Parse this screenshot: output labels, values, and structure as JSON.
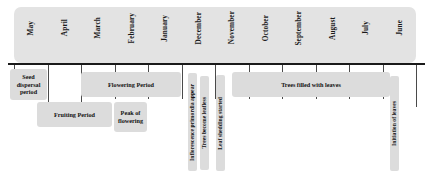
{
  "chart_data": {
    "type": "table",
    "xlabel": "",
    "ylabel": "",
    "grid": false,
    "legend": "none",
    "axis_orientation": "horizontal-reverse-chronological",
    "months": [
      {
        "label": "May",
        "left": 14,
        "width": 33.5
      },
      {
        "label": "April",
        "left": 47.5,
        "width": 33.5
      },
      {
        "label": "March",
        "left": 81,
        "width": 33.5
      },
      {
        "label": "February",
        "left": 114.5,
        "width": 33.5
      },
      {
        "label": "January",
        "left": 148,
        "width": 33.5
      },
      {
        "label": "December",
        "left": 181.5,
        "width": 33.5
      },
      {
        "label": "November",
        "left": 215,
        "width": 33.5
      },
      {
        "label": "October",
        "left": 248.5,
        "width": 33.5
      },
      {
        "label": "September",
        "left": 282,
        "width": 33.5
      },
      {
        "label": "August",
        "left": 315.5,
        "width": 33.5
      },
      {
        "label": "July",
        "left": 349,
        "width": 33.5
      },
      {
        "label": "June",
        "left": 382.5,
        "width": 33.5
      }
    ],
    "ticks": [
      {
        "left": 14,
        "height": 9
      },
      {
        "left": 47.5,
        "height": 42
      },
      {
        "left": 81,
        "height": 42
      },
      {
        "left": 114.5,
        "height": 34
      },
      {
        "left": 148,
        "height": 34
      },
      {
        "left": 181.5,
        "height": 34
      },
      {
        "left": 215,
        "height": 34
      },
      {
        "left": 248.5,
        "height": 34
      },
      {
        "left": 282,
        "height": 34
      },
      {
        "left": 315.5,
        "height": 34
      },
      {
        "left": 349,
        "height": 34
      },
      {
        "left": 382.5,
        "height": 34
      },
      {
        "left": 416,
        "height": 42
      }
    ],
    "phases": [
      {
        "label": "Seed dispersal period",
        "left": 10,
        "top": 69,
        "width": 37,
        "height": 31
      },
      {
        "label": "Flowering Period",
        "left": 81,
        "top": 72,
        "width": 100,
        "height": 25
      },
      {
        "label": "Fruiting Period",
        "left": 37,
        "top": 102,
        "width": 75,
        "height": 25
      },
      {
        "label": "Peak of flowering",
        "left": 114,
        "top": 102,
        "width": 33,
        "height": 30
      },
      {
        "label": "Trees filled with leaves",
        "left": 232,
        "top": 72,
        "width": 158,
        "height": 25
      }
    ],
    "events": [
      {
        "label": "Inflorescence primordia appear",
        "left": 188,
        "top": 73,
        "width": 9,
        "height": 98
      },
      {
        "label": "Trees become leafless",
        "left": 200,
        "top": 76,
        "width": 9,
        "height": 94
      },
      {
        "label": "Leaf shedding started",
        "left": 216,
        "top": 75,
        "width": 9,
        "height": 96
      },
      {
        "label": "Initiation of leaves",
        "left": 390,
        "top": 76,
        "width": 9,
        "height": 95
      }
    ],
    "colors": {
      "header_fill": "#e3e3e3",
      "box_fill": "#dcdcdc",
      "axis": "#1a1a1a",
      "tick": "#4a4a4a",
      "text": "#111111",
      "background": "#ffffff"
    }
  }
}
